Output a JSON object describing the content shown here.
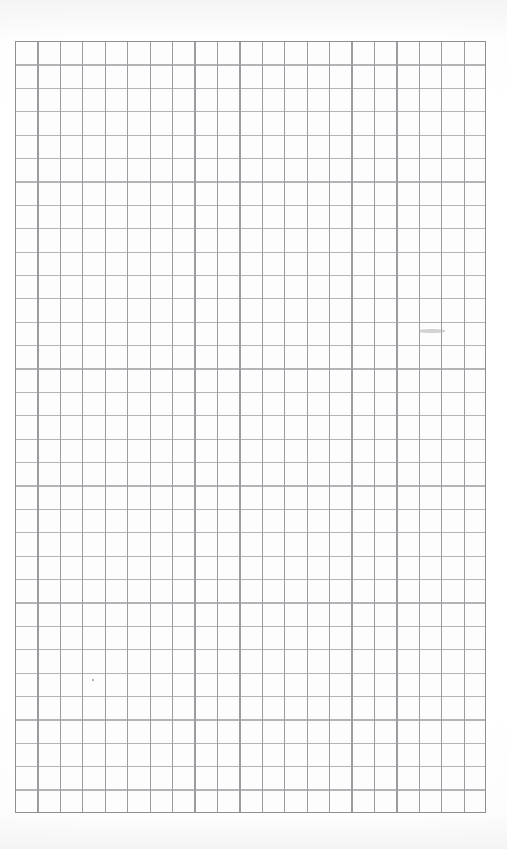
{
  "document": {
    "type": "blank-grid-paper-scan",
    "title": "",
    "visible_text": [],
    "page_width_px": 507,
    "page_height_px": 849,
    "background_color": "#ffffff",
    "paper_tone": "#fdfdfd"
  },
  "grid": {
    "name": "graph-paper-grid",
    "columns": 21,
    "rows": 33,
    "left_px": 15,
    "top_px": 41,
    "width_px": 471,
    "height_px": 772,
    "cell_width_px": 22.43,
    "cell_height_px": 23.39,
    "line_color": "#9c9ca0",
    "line_color_light": "#b4b4b8",
    "border_color": "#8e8e93",
    "line_width_px": 1.2
  },
  "margins": {
    "top_px": 41,
    "bottom_px": 36,
    "left_px": 15,
    "right_px": 21
  },
  "artifacts": {
    "pencil_dot": {
      "label": "pencil-dot-mark",
      "x_px": 92,
      "y_px": 679,
      "size_px": 2.4,
      "color": "#8a8a8e"
    },
    "smudge": {
      "label": "graphite-smudge",
      "x_px": 419,
      "y_px": 329,
      "width_px": 26,
      "height_px": 4,
      "color": "#a8a8ac"
    },
    "edge_shadow_color": "#f1f1f3"
  }
}
